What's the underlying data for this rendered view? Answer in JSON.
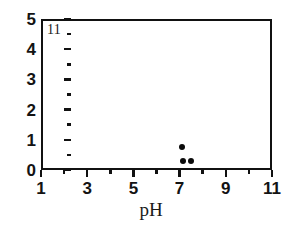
{
  "chart_data": {
    "type": "scatter",
    "title": "",
    "panel_label": "11",
    "xlabel": "pH",
    "ylabel": "",
    "xlim": [
      1,
      11
    ],
    "ylim": [
      0,
      5
    ],
    "grid": false,
    "legend": null,
    "x_ticks_major": [
      1,
      3,
      5,
      7,
      9,
      11
    ],
    "x_tick_labels": [
      "1",
      "3",
      "5",
      "7",
      "9",
      "11"
    ],
    "x_ticks_minor": [
      2,
      4,
      6,
      8,
      10
    ],
    "y_ticks_major": [
      0,
      1,
      2,
      3,
      4,
      5
    ],
    "y_tick_labels": [
      "0",
      "1",
      "2",
      "3",
      "4",
      "5"
    ],
    "y_ticks_minor": [
      0.5,
      1.5,
      2.5,
      3.5,
      4.5
    ],
    "series": [
      {
        "name": "observations",
        "marker": "filled-circle",
        "color": "#0b0b0b",
        "points": [
          {
            "x": 7.1,
            "y": 0.76
          },
          {
            "x": 7.15,
            "y": 0.3
          },
          {
            "x": 7.5,
            "y": 0.3
          }
        ]
      }
    ]
  },
  "figure": {
    "background_color": "#ffffff",
    "frame_color": "#111111",
    "marker_color": "#0b0b0b"
  }
}
